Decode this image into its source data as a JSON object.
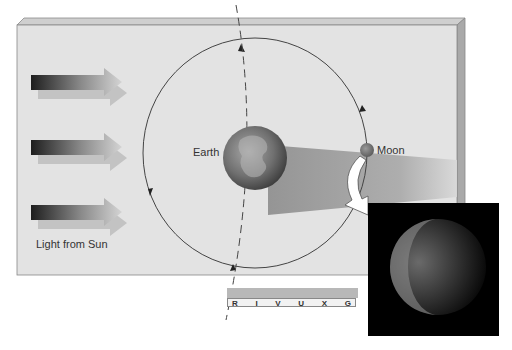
{
  "diagram": {
    "labels": {
      "earth": "Earth",
      "moon": "Moon",
      "sunlight": "Light from Sun"
    },
    "sunlight_arrows": 3,
    "spectrum_bands": [
      "R",
      "I",
      "V",
      "U",
      "X",
      "G"
    ],
    "photo": {
      "subject": "partially eclipsed moon"
    },
    "colors": {
      "panel": "#e3e3e3",
      "panel_edge": "#a8a8a8",
      "shadow_cone": "#9a9a9a",
      "orbit_line": "#444444",
      "earth": "#6e6e6e",
      "moon": "#7a7a7a",
      "photo_bg": "#000000"
    }
  }
}
